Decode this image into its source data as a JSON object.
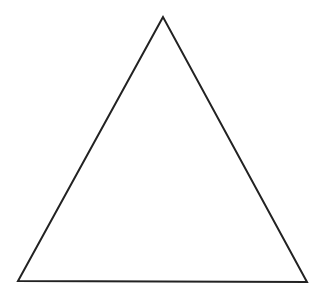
{
  "diagram": {
    "shape": "triangle",
    "stroke_color": "#222222",
    "fill_color": "#ffffff",
    "stroke_width": 2,
    "vertices": {
      "apex": [
        163,
        17
      ],
      "bottom_left": [
        18,
        281
      ],
      "bottom_right": [
        307,
        282
      ]
    },
    "points": "163,17 18,281 307,282"
  }
}
